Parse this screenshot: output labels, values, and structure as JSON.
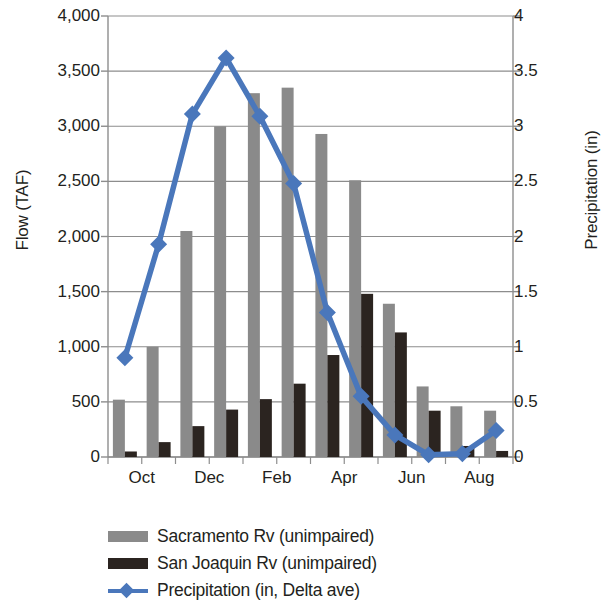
{
  "chart_data": {
    "type": "bar",
    "title": "",
    "subtitle": "",
    "xlabel": "",
    "ylabel": "Flow (TAF)",
    "y2label": "Precipitation (in)",
    "ylim": [
      0,
      4000
    ],
    "y2lim": [
      0,
      4
    ],
    "grid": true,
    "legend_position": "bottom",
    "categories": [
      "Oct",
      "Nov",
      "Dec",
      "Jan",
      "Feb",
      "Mar",
      "Apr",
      "May",
      "Jun",
      "Jul",
      "Aug",
      "Sep"
    ],
    "x_tick_labels": [
      "Oct",
      "",
      "Dec",
      "",
      "Feb",
      "",
      "Apr",
      "",
      "Jun",
      "",
      "Aug",
      ""
    ],
    "y_tick_labels": [
      "0",
      "500",
      "1,000",
      "1,500",
      "2,000",
      "2,500",
      "3,000",
      "3,500",
      "4,000"
    ],
    "y_tick_values": [
      0,
      500,
      1000,
      1500,
      2000,
      2500,
      3000,
      3500,
      4000
    ],
    "y2_tick_labels": [
      "0",
      "0.5",
      "1",
      "1.5",
      "2",
      "2.5",
      "3",
      "3.5",
      "4"
    ],
    "y2_tick_values": [
      0,
      0.5,
      1,
      1.5,
      2,
      2.5,
      3,
      3.5,
      4
    ],
    "series": [
      {
        "name": "Sacramento Rv (unimpaired)",
        "type": "bar",
        "axis": "left",
        "color": "#8a8a8a",
        "values": [
          520,
          1000,
          2050,
          3000,
          3300,
          3350,
          2930,
          2510,
          1390,
          640,
          460,
          420
        ]
      },
      {
        "name": "San Joaquin Rv (unimpaired)",
        "type": "bar",
        "axis": "left",
        "color": "#2b2420",
        "values": [
          50,
          135,
          280,
          430,
          525,
          665,
          925,
          1480,
          1130,
          420,
          100,
          55
        ]
      },
      {
        "name": "Precipitation (in, Delta ave)",
        "type": "line",
        "axis": "right",
        "color": "#4a77bb",
        "marker": "diamond",
        "values": [
          0.9,
          1.93,
          3.11,
          3.62,
          3.09,
          2.48,
          1.31,
          0.55,
          0.2,
          0.02,
          0.03,
          0.24
        ]
      }
    ]
  },
  "legend": {
    "items": [
      {
        "label": "Sacramento Rv (unimpaired)",
        "marker": "bar-swatch",
        "color": "#8a8a8a"
      },
      {
        "label": "San Joaquin Rv (unimpaired)",
        "marker": "bar-swatch",
        "color": "#2b2420"
      },
      {
        "label": "Precipitation (in, Delta ave)",
        "marker": "line-diamond",
        "color": "#4a77bb"
      }
    ]
  },
  "axes": {
    "left_title": "Flow (TAF)",
    "right_title": "Precipitation (in)"
  },
  "colors": {
    "sacramento": "#8a8a8a",
    "san_joaquin": "#2b2420",
    "precipitation": "#4a77bb",
    "grid": "#8d8d8d",
    "text": "#231f20"
  }
}
